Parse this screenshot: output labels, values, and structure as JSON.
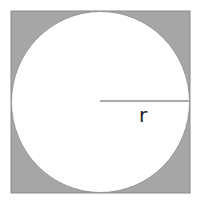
{
  "diagram": {
    "title": "",
    "radius_label": "r",
    "colors": {
      "square_fill": "#a6a6a6",
      "circle_fill": "#ffffff",
      "line": "#555555"
    }
  }
}
